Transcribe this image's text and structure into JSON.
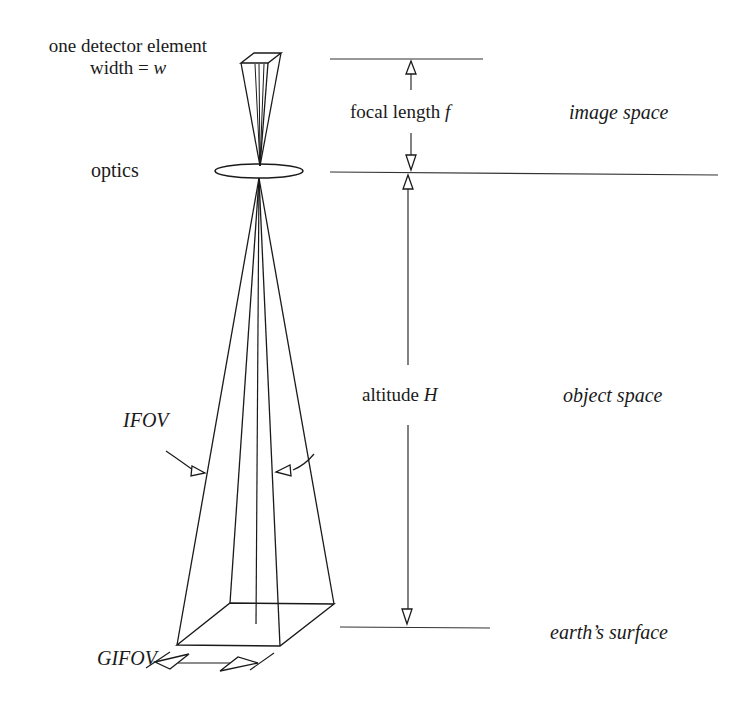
{
  "diagram": {
    "labels": {
      "detector_line1": "one detector element",
      "detector_line2_prefix": "width = ",
      "detector_line2_var": "w",
      "optics": "optics",
      "focal_length_prefix": "focal length ",
      "focal_length_var": "f",
      "image_space": "image space",
      "altitude_prefix": "altitude ",
      "altitude_var": "H",
      "object_space": "object space",
      "ifov": "IFOV",
      "gifov": "GIFOV",
      "earths_surface": "earth’s surface"
    },
    "reference_lines": [
      {
        "name": "detector-plane-line",
        "y": 59,
        "x1": 330,
        "x2": 483
      },
      {
        "name": "optics-plane-line",
        "y": 172,
        "x1": 330,
        "x2": 718
      },
      {
        "name": "earth-surface-line",
        "y": 627,
        "x1": 340,
        "x2": 490
      }
    ],
    "dimensions": [
      {
        "name": "focal-length",
        "from": "detector-plane",
        "to": "optics-plane"
      },
      {
        "name": "altitude",
        "from": "optics-plane",
        "to": "earth-surface"
      }
    ],
    "stroke_color": "#1a1a1a",
    "background": "#ffffff"
  }
}
